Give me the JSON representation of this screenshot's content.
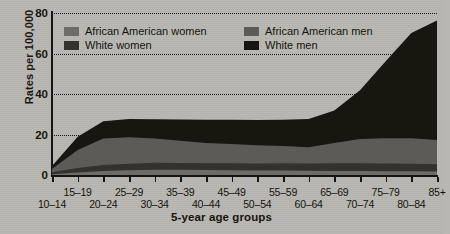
{
  "chart_data": {
    "type": "area",
    "stacked": true,
    "title": "",
    "xlabel": "5-year age groups",
    "ylabel": "Rates per 100,000",
    "ylim": [
      0,
      80
    ],
    "yticks": [
      0,
      20,
      40,
      60,
      80
    ],
    "grid": true,
    "legend_position": "top-inside",
    "categories": [
      "10–14",
      "15–19",
      "20–24",
      "25–29",
      "30–34",
      "35–39",
      "40–44",
      "45–49",
      "50–54",
      "55–59",
      "60–64",
      "65–69",
      "70–74",
      "75–79",
      "80–84",
      "85+"
    ],
    "series": [
      {
        "name": "African American women",
        "color": "#6e6c66",
        "values": [
          0.4,
          1.2,
          2.0,
          2.4,
          2.6,
          2.6,
          2.5,
          2.4,
          2.2,
          2.2,
          2.1,
          2.0,
          2.0,
          1.9,
          1.8,
          1.7
        ]
      },
      {
        "name": "White women",
        "color": "#33322d",
        "values": [
          1.0,
          2.2,
          3.0,
          3.2,
          3.4,
          3.3,
          3.3,
          3.4,
          3.5,
          3.6,
          3.6,
          3.8,
          3.8,
          3.8,
          3.8,
          3.6
        ]
      },
      {
        "name": "African American men",
        "color": "#5d5b55",
        "values": [
          1.6,
          9.0,
          13.0,
          13.0,
          12.0,
          11.0,
          10.0,
          9.5,
          9.0,
          8.5,
          8.0,
          10.0,
          12.0,
          12.5,
          12.5,
          12.0
        ]
      },
      {
        "name": "White men",
        "color": "#17160f",
        "values": [
          1.5,
          6.5,
          8.5,
          9.0,
          9.5,
          10.5,
          11.5,
          12.0,
          12.5,
          13.0,
          14.0,
          16.0,
          24.0,
          38.0,
          52.0,
          59.0
        ]
      }
    ],
    "series_totals": [
      4.5,
      18.9,
      26.5,
      27.6,
      27.5,
      27.4,
      27.3,
      27.3,
      27.2,
      27.3,
      27.7,
      31.8,
      41.8,
      56.2,
      70.1,
      76.3
    ]
  },
  "legend": {
    "entries": [
      {
        "label": "African American women"
      },
      {
        "label": "White women"
      },
      {
        "label": "African American men"
      },
      {
        "label": "White men"
      }
    ]
  },
  "axis": {
    "y_title": "Rates per 100,000",
    "x_title": "5-year age groups",
    "y_tick_labels": [
      "0",
      "20",
      "40",
      "60",
      "80"
    ]
  }
}
